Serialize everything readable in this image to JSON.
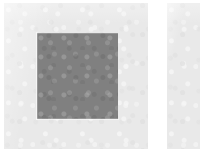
{
  "page": {
    "background_color": "#ffffff",
    "width": 200,
    "height": 149
  },
  "panels": [
    {
      "name": "primary-panel",
      "fill_color": "#e9e9e9",
      "texture": "paper-grain",
      "contents": [
        {
          "name": "fill-square",
          "shape": "square",
          "fill_color": "#808080",
          "edge_highlight_color": "#ffffff"
        }
      ]
    },
    {
      "name": "secondary-panel",
      "fill_color": "#e9e9e9",
      "texture": "paper-grain",
      "cropped": "true",
      "contents": []
    }
  ],
  "gutter": {
    "name": "panel-gutter",
    "fill_color": "#ffffff"
  },
  "labels": {
    "primary_panel": "Primary panel",
    "secondary_panel": "Secondary panel",
    "fill_square": "Gray fill square",
    "gutter": "Panel gutter"
  }
}
